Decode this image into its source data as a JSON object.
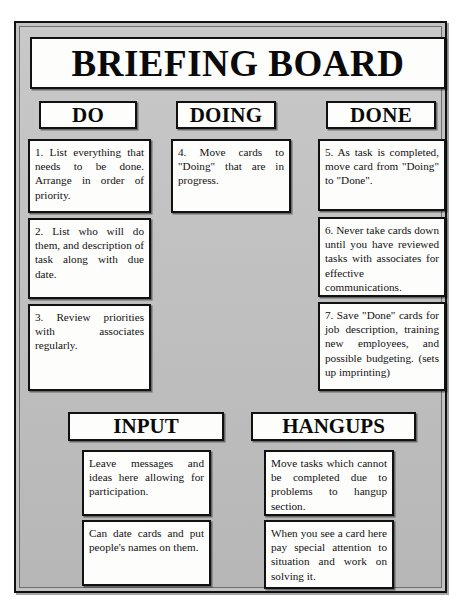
{
  "board": {
    "title": "BRIEFING BOARD"
  },
  "columns": [
    {
      "id": "do",
      "header": "DO",
      "cards": [
        {
          "text": "1.  List everything that needs to be done.  Arrange in order of priority."
        },
        {
          "text": "2.  List who will do them, and description of task along with due date."
        },
        {
          "text": "3.  Review priorities with associates regularly."
        }
      ]
    },
    {
      "id": "doing",
      "header": "DOING",
      "cards": [
        {
          "text": "4.  Move cards to \"Doing\" that are in progress."
        }
      ]
    },
    {
      "id": "done",
      "header": "DONE",
      "cards": [
        {
          "text": "5. As task is completed, move card from \"Doing\" to \"Done\"."
        },
        {
          "text": "6.  Never take cards down until you have reviewed tasks with associates for effective communications."
        },
        {
          "text": "7. Save \"Done\" cards for job description, training new employees, and possible budgeting. (sets up imprinting)"
        }
      ]
    }
  ],
  "sections": [
    {
      "id": "input",
      "header": "INPUT",
      "cards": [
        {
          "text": "Leave messages and ideas here allowing for participation."
        },
        {
          "text": "Can date cards and put people's names on them."
        }
      ]
    },
    {
      "id": "hangups",
      "header": "HANGUPS",
      "cards": [
        {
          "text": "Move tasks which cannot be completed due to problems to hangup section."
        },
        {
          "text": "When you see a card here pay special attention to situation and work on solving it."
        }
      ]
    }
  ]
}
